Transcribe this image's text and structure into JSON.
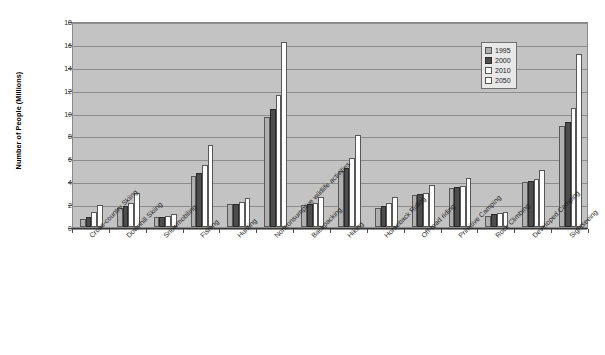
{
  "chart_data": {
    "type": "bar",
    "title": "",
    "xlabel": "",
    "ylabel": "Number of People (Millions)",
    "ylim": [
      0,
      18
    ],
    "ytick_step": 2,
    "yticks": [
      0,
      2,
      4,
      6,
      8,
      10,
      12,
      14,
      16,
      18
    ],
    "grid": true,
    "legend_position": "top-right",
    "categories": [
      "Cross-country Skiing",
      "Downhill Skiing",
      "Snowmobiling",
      "Fishing",
      "Hunting",
      "Nonconsumptive wildlife activities",
      "Backpacking",
      "Hiking",
      "Horseback Riding",
      "Off-road riding",
      "Primitive Camping",
      "Rock Climbing",
      "Developed Camping",
      "Sightseeing"
    ],
    "series": [
      {
        "name": "1995",
        "color": "#b0b0b0",
        "values": [
          0.7,
          1.7,
          0.9,
          4.5,
          2.0,
          9.6,
          1.9,
          4.9,
          1.7,
          2.8,
          3.4,
          1.0,
          3.9,
          8.8
        ]
      },
      {
        "name": "2000",
        "color": "#4d4d4d",
        "values": [
          0.9,
          1.8,
          0.9,
          4.7,
          2.0,
          10.3,
          2.0,
          5.2,
          1.8,
          2.9,
          3.5,
          1.1,
          4.0,
          9.2
        ]
      },
      {
        "name": "2010",
        "color": "#fbfbfb",
        "values": [
          1.3,
          2.1,
          1.0,
          5.4,
          2.2,
          11.5,
          2.1,
          6.0,
          2.1,
          3.0,
          3.6,
          1.2,
          4.2,
          10.4
        ]
      },
      {
        "name": "2050",
        "color": "#ffffff",
        "values": [
          1.9,
          3.0,
          1.1,
          7.2,
          2.5,
          16.2,
          2.6,
          8.0,
          2.6,
          3.7,
          4.3,
          1.3,
          5.0,
          15.1
        ]
      }
    ]
  },
  "legend": {
    "entries": [
      {
        "label": "1995"
      },
      {
        "label": "2000"
      },
      {
        "label": "2010"
      },
      {
        "label": "2050"
      }
    ]
  }
}
